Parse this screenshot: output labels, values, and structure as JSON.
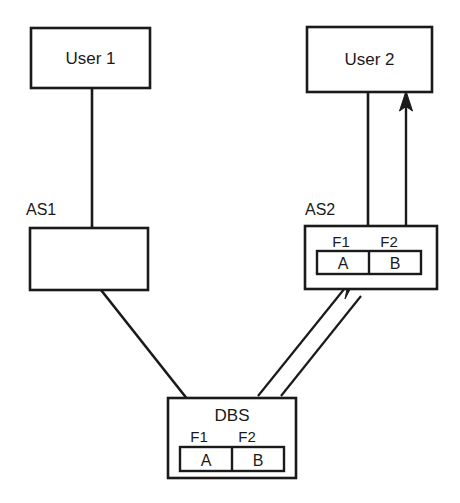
{
  "diagram": {
    "background_color": "#ffffff",
    "stroke_color": "#1a1a1a",
    "nodes": {
      "user1": {
        "label": "User 1"
      },
      "user2": {
        "label": "User 2"
      },
      "as1": {
        "label": "AS1"
      },
      "as2": {
        "label": "AS2",
        "fields": [
          {
            "name": "F1",
            "value": "A"
          },
          {
            "name": "F2",
            "value": "B"
          }
        ]
      },
      "dbs": {
        "label": "DBS",
        "fields": [
          {
            "name": "F1",
            "value": "A"
          },
          {
            "name": "F2",
            "value": "B"
          }
        ]
      }
    },
    "edges": {
      "user1_as1": {
        "style": "plain-line",
        "arrow": "none"
      },
      "user2_as2": {
        "style": "plain-line",
        "arrow": "none"
      },
      "as2_user2": {
        "style": "single-line",
        "arrow": "up"
      },
      "as1_dbs": {
        "style": "plain-line",
        "arrow": "none"
      },
      "dbs_as2": {
        "style": "double-line",
        "arrow": "up-right"
      }
    }
  }
}
